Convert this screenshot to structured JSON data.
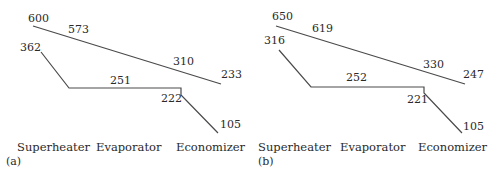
{
  "panels": [
    {
      "id": "a",
      "panel_label": "(a)",
      "gas_line": {
        "inlet": "600",
        "superheater_exit": "573",
        "economizer_inlet": "310",
        "exit": "233"
      },
      "steam_line": {
        "superheat_out": "362",
        "evaporation": "251",
        "economizer_out": "222",
        "feedwater_in": "105"
      },
      "sections": [
        "Superheater",
        "Evaporator",
        "Economizer"
      ]
    },
    {
      "id": "b",
      "panel_label": "(b)",
      "gas_line": {
        "inlet": "650",
        "superheater_exit": "619",
        "economizer_inlet": "330",
        "exit": "247"
      },
      "steam_line": {
        "superheat_out": "316",
        "evaporation": "252",
        "economizer_out": "221",
        "feedwater_in": "105"
      },
      "sections": [
        "Superheater",
        "Evaporator",
        "Economizer"
      ]
    }
  ],
  "colors": {
    "line": "#4a4a4a",
    "text": "#2a2a2a"
  }
}
